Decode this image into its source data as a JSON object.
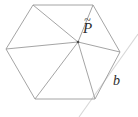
{
  "figure": {
    "stroke_color": "#9a9a9a",
    "faint_stroke_color": "#d8d8d8",
    "point_color": "#4a4a4a",
    "label_color": "#2b2b2b",
    "background": "#ffffff",
    "labels": {
      "interior_point": "P",
      "interior_point_accent": "~",
      "interior_point_full": "P̃",
      "edge_label": "b"
    },
    "vertices": [
      {
        "name": "top-left",
        "x": 33,
        "y": 5
      },
      {
        "name": "top-right",
        "x": 93,
        "y": 5
      },
      {
        "name": "right",
        "x": 120,
        "y": 52
      },
      {
        "name": "bottom-right",
        "x": 95,
        "y": 99
      },
      {
        "name": "bottom-left",
        "x": 35,
        "y": 99
      },
      {
        "name": "left",
        "x": 6,
        "y": 49
      }
    ],
    "interior_point": {
      "name": "P-tilde",
      "x": 78,
      "y": 42
    },
    "boundary_path": "M33,5 L93,5 L120,52 L95,99 L35,99 L6,49 Z",
    "spokes": [
      {
        "from": "P-tilde",
        "to": "top-left",
        "d": "M78,42 L33,5"
      },
      {
        "from": "P-tilde",
        "to": "top-right",
        "d": "M78,42 L93,5"
      },
      {
        "from": "P-tilde",
        "to": "right",
        "d": "M78,42 L120,52"
      },
      {
        "from": "P-tilde",
        "to": "bottom-right",
        "d": "M78,42 L95,99"
      },
      {
        "from": "P-tilde",
        "to": "bottom-left",
        "d": "M78,42 L35,99"
      },
      {
        "from": "P-tilde",
        "to": "left",
        "d": "M78,42 L6,49"
      }
    ],
    "faint_line": {
      "name": "extended-diagonal",
      "d": "M79,117 L138,34"
    }
  }
}
